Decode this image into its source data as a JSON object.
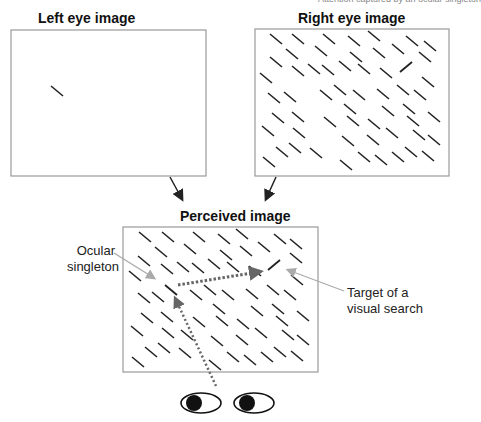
{
  "header_fragment": "Attention captured by an ocular singleton",
  "panels": {
    "left_eye": {
      "title": "Left eye image"
    },
    "right_eye": {
      "title": "Right eye image"
    },
    "perceived": {
      "title": "Perceived image"
    }
  },
  "annotations": {
    "ocular_singleton": [
      "Ocular",
      "singleton"
    ],
    "target": [
      "Target of a",
      "visual search"
    ]
  },
  "colors": {
    "frame": "#999999",
    "bar": "#222222",
    "pointer": "#aaaaaa",
    "dotted_path": "#666666"
  }
}
